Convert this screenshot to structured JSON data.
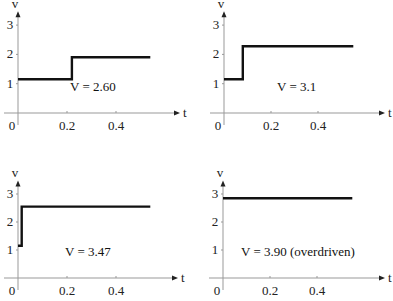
{
  "chart_data": [
    {
      "type": "line",
      "title": "",
      "annotation": "V = 2.60",
      "xlabel": "t",
      "ylabel": "v",
      "xticks": [
        "0",
        "0.2",
        "0.4"
      ],
      "yticks": [
        "1",
        "2",
        "3"
      ],
      "xlim": [
        0,
        0.62
      ],
      "ylim": [
        0,
        3.2
      ],
      "grid": false,
      "step": true,
      "x": [
        0,
        0.22,
        0.22,
        0.54
      ],
      "y": [
        1.15,
        1.15,
        1.9,
        1.9
      ]
    },
    {
      "type": "line",
      "title": "",
      "annotation": "V = 3.1",
      "xlabel": "t",
      "ylabel": "v",
      "xticks": [
        "0",
        "0.2",
        "0.4"
      ],
      "yticks": [
        "1",
        "2",
        "3"
      ],
      "xlim": [
        0,
        0.62
      ],
      "ylim": [
        0,
        3.2
      ],
      "grid": false,
      "step": true,
      "x": [
        0,
        0.08,
        0.08,
        0.55
      ],
      "y": [
        1.15,
        1.15,
        2.28,
        2.28
      ]
    },
    {
      "type": "line",
      "title": "",
      "annotation": "V = 3.47",
      "xlabel": "t",
      "ylabel": "v",
      "xticks": [
        "0",
        "0.2",
        "0.4"
      ],
      "yticks": [
        "1",
        "2",
        "3"
      ],
      "xlim": [
        0,
        0.62
      ],
      "ylim": [
        0,
        3.2
      ],
      "grid": false,
      "step": true,
      "x": [
        0,
        0.015,
        0.015,
        0.54
      ],
      "y": [
        1.15,
        1.15,
        2.55,
        2.55
      ]
    },
    {
      "type": "line",
      "title": "",
      "annotation": "V = 3.90 (overdriven)",
      "xlabel": "t",
      "ylabel": "v",
      "xticks": [
        "0",
        "0.2",
        "0.4"
      ],
      "yticks": [
        "1",
        "2",
        "3"
      ],
      "xlim": [
        0,
        0.62
      ],
      "ylim": [
        0,
        3.2
      ],
      "grid": false,
      "step": false,
      "x": [
        0,
        0.55
      ],
      "y": [
        2.85,
        2.85
      ]
    }
  ],
  "panels": [
    {
      "ox": 18,
      "oy": 113,
      "xs": 245,
      "ys": 29.3,
      "axisEnd": 180,
      "annX": 70,
      "annY": 91
    },
    {
      "ox": 224,
      "oy": 113,
      "xs": 235,
      "ys": 29.3,
      "axisEnd": 385,
      "annX": 277,
      "annY": 91
    },
    {
      "ox": 18,
      "oy": 278,
      "xs": 245,
      "ys": 28.0,
      "axisEnd": 178,
      "annX": 65,
      "annY": 256
    },
    {
      "ox": 223,
      "oy": 278,
      "xs": 235,
      "ys": 28.0,
      "axisEnd": 385,
      "annX": 241,
      "annY": 256
    }
  ]
}
